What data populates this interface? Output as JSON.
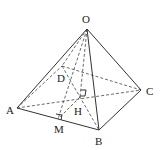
{
  "diagram": {
    "type": "geometry",
    "labels": {
      "O": "O",
      "A": "A",
      "B": "B",
      "C": "C",
      "D": "D",
      "H": "H",
      "M": "M"
    },
    "points": {
      "O": [
        87,
        29
      ],
      "A": [
        17,
        108
      ],
      "B": [
        99,
        130
      ],
      "C": [
        141,
        90
      ],
      "D": [
        62,
        66
      ],
      "H": [
        80,
        97
      ],
      "M": [
        58,
        119
      ]
    },
    "solid_edges": [
      [
        "O",
        "A"
      ],
      [
        "O",
        "B"
      ],
      [
        "O",
        "C"
      ],
      [
        "A",
        "B"
      ],
      [
        "B",
        "C"
      ]
    ],
    "dashed_edges": [
      [
        "O",
        "D"
      ],
      [
        "A",
        "D"
      ],
      [
        "D",
        "C"
      ],
      [
        "A",
        "C"
      ],
      [
        "D",
        "B"
      ],
      [
        "O",
        "H"
      ],
      [
        "O",
        "M"
      ],
      [
        "H",
        "M"
      ]
    ],
    "right_angles": [
      "H",
      "M"
    ]
  }
}
